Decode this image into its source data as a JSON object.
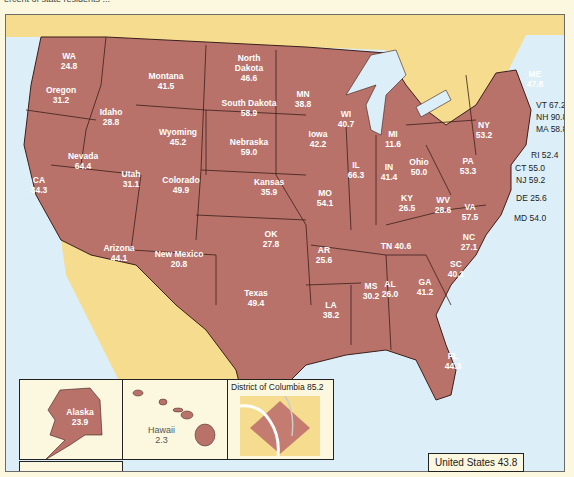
{
  "header": {
    "cut_text": "ercent of state residents ..."
  },
  "colors": {
    "state_fill": "#b8726a",
    "state_border": "#3b1f1a",
    "land_other": "#f5dc8e",
    "water": "#dceff8",
    "page_bg": "#fbf8df",
    "label_text": "#ffffff"
  },
  "states": [
    {
      "abbr": "WA",
      "name": "WA",
      "value": "24.8"
    },
    {
      "abbr": "OR",
      "name": "Oregon",
      "value": "31.2"
    },
    {
      "abbr": "ID",
      "name": "Idaho",
      "value": "28.8"
    },
    {
      "abbr": "MT",
      "name": "Montana",
      "value": "41.5"
    },
    {
      "abbr": "WY",
      "name": "Wyoming",
      "value": "45.2"
    },
    {
      "abbr": "CA",
      "name": "CA",
      "value": "34.3"
    },
    {
      "abbr": "NV",
      "name": "Nevada",
      "value": "64.4"
    },
    {
      "abbr": "UT",
      "name": "Utah",
      "value": "31.1"
    },
    {
      "abbr": "CO",
      "name": "Colorado",
      "value": "49.9"
    },
    {
      "abbr": "AZ",
      "name": "Arizona",
      "value": "44.1"
    },
    {
      "abbr": "NM",
      "name": "New Mexico",
      "value": "20.8"
    },
    {
      "abbr": "ND",
      "name": "North Dakota",
      "value": "46.6"
    },
    {
      "abbr": "SD",
      "name": "South Dakota",
      "value": "58.9"
    },
    {
      "abbr": "NE",
      "name": "Nebraska",
      "value": "59.0"
    },
    {
      "abbr": "KS",
      "name": "Kansas",
      "value": "35.9"
    },
    {
      "abbr": "OK",
      "name": "OK",
      "value": "27.8"
    },
    {
      "abbr": "TX",
      "name": "Texas",
      "value": "49.4"
    },
    {
      "abbr": "MN",
      "name": "MN",
      "value": "38.8"
    },
    {
      "abbr": "IA",
      "name": "Iowa",
      "value": "42.2"
    },
    {
      "abbr": "MO",
      "name": "MO",
      "value": "54.1"
    },
    {
      "abbr": "AR",
      "name": "AR",
      "value": "25.6"
    },
    {
      "abbr": "LA",
      "name": "LA",
      "value": "38.2"
    },
    {
      "abbr": "WI",
      "name": "WI",
      "value": "40.7"
    },
    {
      "abbr": "IL",
      "name": "IL",
      "value": "66.3"
    },
    {
      "abbr": "MS",
      "name": "MS",
      "value": "30.2"
    },
    {
      "abbr": "MI",
      "name": "MI",
      "value": "11.6"
    },
    {
      "abbr": "IN",
      "name": "IN",
      "value": "41.4"
    },
    {
      "abbr": "OH",
      "name": "Ohio",
      "value": "50.0"
    },
    {
      "abbr": "KY",
      "name": "KY",
      "value": "26.5"
    },
    {
      "abbr": "TN",
      "name": "TN",
      "value": "40.6"
    },
    {
      "abbr": "AL",
      "name": "AL",
      "value": "26.0"
    },
    {
      "abbr": "GA",
      "name": "GA",
      "value": "41.2"
    },
    {
      "abbr": "FL",
      "name": "FL",
      "value": "44.3"
    },
    {
      "abbr": "SC",
      "name": "SC",
      "value": "40.1"
    },
    {
      "abbr": "NC",
      "name": "NC",
      "value": "27.1"
    },
    {
      "abbr": "VA",
      "name": "VA",
      "value": "57.5"
    },
    {
      "abbr": "WV",
      "name": "WV",
      "value": "28.6"
    },
    {
      "abbr": "PA",
      "name": "PA",
      "value": "53.3"
    },
    {
      "abbr": "NY",
      "name": "NY",
      "value": "53.2"
    },
    {
      "abbr": "ME",
      "name": "ME",
      "value": "47.8"
    }
  ],
  "callouts": [
    {
      "abbr": "VT",
      "text": "VT 67.2"
    },
    {
      "abbr": "NH",
      "text": "NH 90.8"
    },
    {
      "abbr": "MA",
      "text": "MA 58.8"
    },
    {
      "abbr": "RI",
      "text": "RI 52.4"
    },
    {
      "abbr": "CT",
      "text": "CT 55.0"
    },
    {
      "abbr": "NJ",
      "text": "NJ 59.2"
    },
    {
      "abbr": "DE",
      "text": "DE 25.6"
    },
    {
      "abbr": "MD",
      "text": "MD 54.0"
    }
  ],
  "insets": {
    "alaska": {
      "name": "Alaska",
      "value": "23.9"
    },
    "hawaii": {
      "name": "Hawaii",
      "value": "2.3"
    },
    "dc": {
      "title": "District of Columbia 85.2"
    }
  },
  "total": {
    "label": "United States 43.8"
  }
}
